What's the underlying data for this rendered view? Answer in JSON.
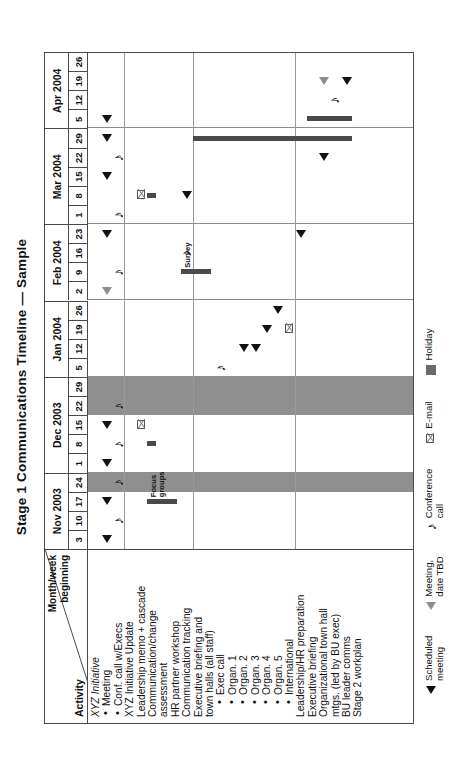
{
  "chart_data": {
    "type": "table",
    "title": "Stage 1 Communications Timeline — Sample",
    "corner": {
      "month_week_label": "Month/week\nbeginning",
      "activity_label": "Activity"
    },
    "months": [
      {
        "label": "Nov 2003",
        "weeks": [
          "3",
          "10",
          "17",
          "24"
        ]
      },
      {
        "label": "Dec 2003",
        "weeks": [
          "1",
          "8",
          "15",
          "22",
          "29"
        ]
      },
      {
        "label": "Jan 2004",
        "weeks": [
          "5",
          "12",
          "19",
          "26"
        ]
      },
      {
        "label": "Feb 2004",
        "weeks": [
          "2",
          "9",
          "16",
          "23"
        ]
      },
      {
        "label": "Mar 2004",
        "weeks": [
          "1",
          "8",
          "15",
          "22",
          "29"
        ]
      },
      {
        "label": "Apr 2004",
        "weeks": [
          "5",
          "12",
          "19",
          "26"
        ]
      }
    ],
    "activities": [
      {
        "label": "XYZ Initiative",
        "style": "italic"
      },
      {
        "label": "Meeting",
        "style": "bullet"
      },
      {
        "label": "Conf. call w/Execs",
        "style": "bullet"
      },
      {
        "label": "XYZ Initiative Update",
        "style": "plain"
      },
      {
        "label": "Leadership memo + cascade",
        "style": "plain"
      },
      {
        "label": "Communication/change",
        "style": "plain"
      },
      {
        "label": "assessment",
        "style": "plain"
      },
      {
        "label": "HR partner workshop",
        "style": "plain"
      },
      {
        "label": "Communication tracking",
        "style": "plain"
      },
      {
        "label": "Executive briefing and",
        "style": "plain"
      },
      {
        "label": "town halls (all staff)",
        "style": "plain"
      },
      {
        "label": "Exec call",
        "style": "bullet"
      },
      {
        "label": "Organ. 1",
        "style": "bullet"
      },
      {
        "label": "Organ. 2",
        "style": "bullet"
      },
      {
        "label": "Organ. 3",
        "style": "bullet"
      },
      {
        "label": "Organ. 4",
        "style": "bullet"
      },
      {
        "label": "Organ. 5",
        "style": "bullet"
      },
      {
        "label": "International",
        "style": "bullet"
      },
      {
        "label": "Leadership/HR preparation",
        "style": "plain"
      },
      {
        "label": "Executive briefing",
        "style": "plain"
      },
      {
        "label": "Organizational town hall",
        "style": "plain"
      },
      {
        "label": "mtgs. (led by BU exec)",
        "style": "plain"
      },
      {
        "label": "BU leader comms",
        "style": "plain"
      },
      {
        "label": "Stage 2 workplan",
        "style": "plain"
      }
    ],
    "holiday_columns": [
      "Nov 24",
      "Dec 22",
      "Dec 29"
    ],
    "markers": [
      {
        "type": "meeting",
        "week": "Nov 3",
        "row": 1
      },
      {
        "type": "conference-call",
        "week": "Nov 10",
        "row": 2
      },
      {
        "type": "meeting",
        "week": "Nov 17",
        "row": 1
      },
      {
        "type": "conference-call",
        "week": "Nov 24",
        "row": 2
      },
      {
        "type": "meeting",
        "week": "Dec 1",
        "row": 1
      },
      {
        "type": "conference-call",
        "week": "Dec 8",
        "row": 2
      },
      {
        "type": "meeting",
        "week": "Dec 15",
        "row": 1
      },
      {
        "type": "conference-call",
        "week": "Dec 22",
        "row": 2
      },
      {
        "type": "meeting",
        "week": "Feb 2",
        "row": 1,
        "variant": "tbd"
      },
      {
        "type": "conference-call",
        "week": "Feb 9",
        "row": 2
      },
      {
        "type": "meeting",
        "week": "Feb 23",
        "row": 1
      },
      {
        "type": "conference-call",
        "week": "Mar 1",
        "row": 2
      },
      {
        "type": "meeting",
        "week": "Mar 15",
        "row": 1
      },
      {
        "type": "conference-call",
        "week": "Mar 22",
        "row": 2
      },
      {
        "type": "meeting",
        "week": "Mar 29",
        "row": 1
      },
      {
        "type": "meeting",
        "week": "Apr 5",
        "row": 1
      },
      {
        "type": "email",
        "week": "Dec 15",
        "row": 4
      },
      {
        "type": "email",
        "week": "Mar 8",
        "row": 4
      },
      {
        "type": "email",
        "week": "Jan 19",
        "row": 17
      },
      {
        "type": "holiday-bar",
        "week": "Dec 8",
        "row": 5,
        "label": ""
      },
      {
        "type": "holiday-bar",
        "week": "Mar 8",
        "row": 5,
        "label": ""
      },
      {
        "type": "survey-bar",
        "week": "Feb 9",
        "row": 8,
        "label": "Survey"
      },
      {
        "type": "focus-bar",
        "week": "Nov 17",
        "row": 5,
        "label": "Focus\ngroups"
      },
      {
        "type": "conference-call",
        "week": "Feb 16",
        "row": 8
      },
      {
        "type": "meeting",
        "week": "Mar 8",
        "row": 8
      },
      {
        "type": "conference-call",
        "week": "Jan 5",
        "row": 11
      },
      {
        "type": "meeting",
        "week": "Jan 12",
        "row": 13
      },
      {
        "type": "meeting",
        "week": "Jan 12",
        "row": 14
      },
      {
        "type": "meeting",
        "week": "Jan 19",
        "row": 15
      },
      {
        "type": "meeting",
        "week": "Jan 26",
        "row": 16
      },
      {
        "type": "meeting",
        "week": "Feb 23",
        "row": 18
      },
      {
        "type": "meeting",
        "week": "Mar 22",
        "row": 20
      },
      {
        "type": "meeting",
        "week": "Apr 19",
        "row": 20,
        "variant": "tbd"
      },
      {
        "type": "conference-call",
        "week": "Apr 12",
        "row": 21
      },
      {
        "type": "meeting",
        "week": "Apr 19",
        "row": 22
      },
      {
        "type": "long-bar",
        "week": "Mar 29",
        "row_start": 9,
        "row_end": 23
      },
      {
        "type": "long-bar",
        "week": "Apr 5",
        "row_start": 19,
        "row_end": 23
      }
    ],
    "legend": [
      {
        "icon": "black-triangle",
        "label": "Scheduled\nmeeting"
      },
      {
        "icon": "gray-triangle",
        "label": "Meeting,\ndate TBD"
      },
      {
        "icon": "music-note",
        "label": "Conference\ncall"
      },
      {
        "icon": "envelope",
        "label": "E-mail"
      },
      {
        "icon": "gray-square",
        "label": "Holiday"
      }
    ],
    "colors": {
      "marker_black": "#111111",
      "marker_gray": "#8e8e8e",
      "bar_dark": "#4a4a4a",
      "holiday_band": "#8f8f8f",
      "grid_line": "#4a4a4a"
    }
  }
}
